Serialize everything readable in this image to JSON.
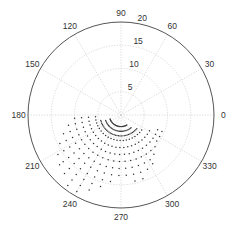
{
  "chart_data": {
    "type": "scatter",
    "coordinate_system": "polar",
    "title": "",
    "angle_unit": "degrees",
    "theta_ticks": [
      0,
      30,
      60,
      90,
      120,
      150,
      180,
      210,
      240,
      270,
      300,
      330
    ],
    "theta_tick_labels": [
      "0",
      "30",
      "60",
      "90",
      "120",
      "150",
      "180",
      "210",
      "240",
      "270",
      "300",
      "330"
    ],
    "r_ticks": [
      5,
      10,
      15,
      20
    ],
    "r_tick_labels": [
      "5",
      "10",
      "15",
      "20"
    ],
    "r_tick_label_angle": 80,
    "rlim": [
      0,
      20
    ],
    "grid": true,
    "marker": ".",
    "marker_color": "#333333",
    "series": [
      {
        "name": "points",
        "by_angle": [
          {
            "theta": 184,
            "r": [
              5.5,
              7.0,
              8.5,
              10.0
            ]
          },
          {
            "theta": 191,
            "r": [
              5.5,
              7.0,
              8.5,
              10.0,
              11.5
            ]
          },
          {
            "theta": 198,
            "r": [
              5.5,
              7.0,
              8.5,
              10.0,
              11.5,
              13.0
            ]
          },
          {
            "theta": 205,
            "r": [
              5.5,
              7.0,
              8.5,
              10.0,
              11.5,
              13.0,
              14.5
            ]
          },
          {
            "theta": 212,
            "r": [
              5.5,
              7.0,
              8.5,
              10.0,
              11.5,
              13.0,
              14.5,
              16.0
            ]
          },
          {
            "theta": 219,
            "r": [
              5.5,
              7.0,
              8.5,
              10.0,
              11.5,
              13.0,
              14.5,
              16.0,
              17.0
            ]
          },
          {
            "theta": 226,
            "r": [
              5.5,
              7.0,
              8.5,
              10.0,
              11.5,
              13.0,
              14.5,
              16.0,
              17.5
            ]
          },
          {
            "theta": 233,
            "r": [
              5.5,
              7.0,
              8.5,
              10.0,
              11.5,
              13.0,
              14.5,
              16.0,
              17.5,
              19.0
            ]
          },
          {
            "theta": 240,
            "r": [
              5.5,
              7.0,
              8.5,
              10.0,
              11.5,
              13.0,
              14.5,
              16.0,
              17.5,
              19.0
            ]
          },
          {
            "theta": 247,
            "r": [
              5.5,
              7.0,
              8.5,
              10.0,
              11.5,
              13.0,
              14.5,
              16.0,
              17.5
            ]
          },
          {
            "theta": 254,
            "r": [
              5.5,
              7.0,
              8.5,
              10.0,
              11.5,
              13.0,
              14.5,
              16.0
            ]
          },
          {
            "theta": 261,
            "r": [
              5.5,
              7.0,
              8.5,
              10.0,
              11.5,
              13.0,
              14.5
            ]
          },
          {
            "theta": 268,
            "r": [
              5.5,
              7.0,
              8.5,
              10.0,
              11.5,
              13.0
            ]
          },
          {
            "theta": 275,
            "r": [
              5.5,
              7.0,
              8.5,
              10.0,
              11.5,
              13.0
            ]
          },
          {
            "theta": 282,
            "r": [
              5.5,
              7.0,
              8.5,
              10.0,
              11.5,
              13.0,
              14.5
            ]
          },
          {
            "theta": 289,
            "r": [
              5.5,
              7.0,
              8.5,
              10.0,
              11.5,
              13.0,
              14.5
            ]
          },
          {
            "theta": 296,
            "r": [
              5.5,
              7.0,
              8.5,
              10.0,
              11.5,
              13.0
            ]
          },
          {
            "theta": 303,
            "r": [
              5.5,
              7.0,
              8.5,
              10.0,
              11.5,
              12.5
            ]
          },
          {
            "theta": 310,
            "r": [
              5.5,
              7.0,
              8.5,
              10.0,
              11.0
            ]
          },
          {
            "theta": 317,
            "r": [
              5.5,
              7.0,
              8.5,
              10.0
            ]
          },
          {
            "theta": 324,
            "r": [
              5.5,
              7.0,
              8.5,
              9.5
            ]
          },
          {
            "theta": 331,
            "r": [
              7.0,
              8.5,
              9.5
            ]
          },
          {
            "theta": 338,
            "r": [
              8.5,
              9.5
            ]
          }
        ]
      },
      {
        "name": "inner-arcs",
        "by_radius": [
          {
            "r": 2.5,
            "theta_range": [
              200,
              300
            ],
            "step": 4
          },
          {
            "r": 3.5,
            "theta_range": [
              200,
              310
            ],
            "step": 4
          },
          {
            "r": 4.5,
            "theta_range": [
              195,
              320
            ],
            "step": 4
          }
        ]
      }
    ]
  }
}
